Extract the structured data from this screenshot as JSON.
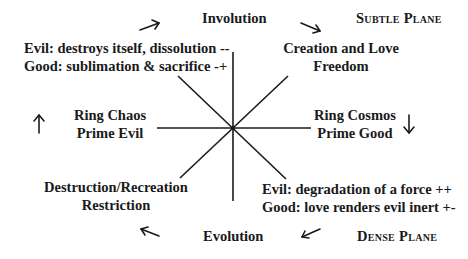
{
  "top": {
    "center_label": "Involution",
    "plane_label": "Subtle Plane"
  },
  "bottom": {
    "center_label": "Evolution",
    "plane_label": "Dense Plane"
  },
  "top_left": {
    "line1": "Evil: destroys itself, dissolution --",
    "line2": "Good: sublimation & sacrifice -+"
  },
  "top_right": {
    "line1": "Creation and Love",
    "line2": "Freedom"
  },
  "left": {
    "line1": "Ring Chaos",
    "line2": "Prime Evil"
  },
  "right": {
    "line1": "Ring Cosmos",
    "line2": "Prime Good"
  },
  "bottom_left": {
    "line1": "Destruction/Recreation",
    "line2": "Restriction"
  },
  "bottom_right": {
    "line1": "Evil: degradation of a force ++",
    "line2": "Good: love renders evil inert +-"
  },
  "arrows": {
    "top_left": "arrow-up-right",
    "top_right": "arrow-down-right",
    "left": "arrow-up",
    "right": "arrow-down",
    "bottom_left": "arrow-up-left",
    "bottom_right": "arrow-down-left"
  },
  "colors": {
    "ink": "#1a1a1a",
    "background": "#ffffff"
  }
}
